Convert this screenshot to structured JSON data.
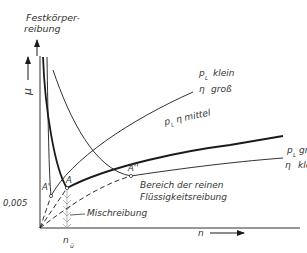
{
  "title": {
    "line1": "Festkörper-",
    "line2": "reibung"
  },
  "axes": {
    "y_label": "μ",
    "x_label": "n",
    "y_tick": "0,005",
    "x_tick_main": "n",
    "x_tick_sub": "ü"
  },
  "points": {
    "a": "A",
    "a_prime": "A'",
    "a_dprime": "A''"
  },
  "curves": {
    "c1": {
      "p": "p",
      "p_sub": "L",
      "p_state": "klein",
      "eta": "η",
      "eta_state": "groß"
    },
    "c2": {
      "label": "p",
      "sub": "L",
      "rest": "η mittel"
    },
    "c3": {
      "p": "p",
      "p_sub": "L",
      "p_state": "groß",
      "eta": "η",
      "eta_state": "klein"
    }
  },
  "regions": {
    "fluid_line1": "Bereich der reinen",
    "fluid_line2": "Flüssigkeitsreibung",
    "mixed": "Mischreibung"
  },
  "colors": {
    "ink": "#1a1a1a",
    "text": "#333333",
    "hatch": "#888888"
  }
}
